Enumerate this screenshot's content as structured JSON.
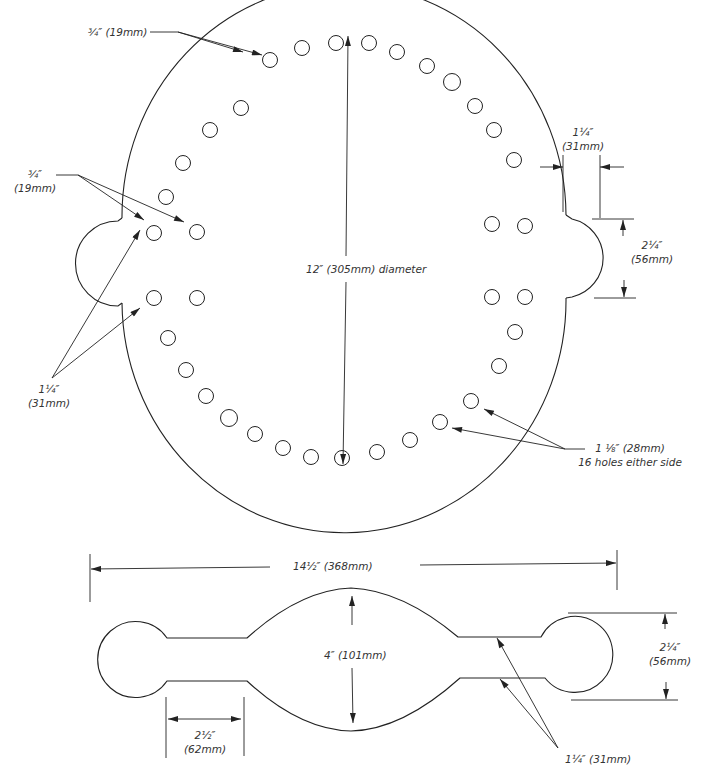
{
  "diagram": {
    "type": "technical-drawing",
    "colors": {
      "line": "#222222",
      "text": "#333333",
      "background": "#ffffff"
    },
    "top_part": {
      "name": "circular plate with side lugs",
      "labels": {
        "top_hole_size": "¾″ (19mm)",
        "left_hole_size_line1": "¾″",
        "left_hole_size_line2": "(19mm)",
        "left_spacing_line1": "1¼″",
        "left_spacing_line2": "(31mm)",
        "diameter": "12″ (305mm) diameter",
        "right_offset_line1": "1¼″",
        "right_offset_line2": "(31mm)",
        "lug_width_line1": "2¼″",
        "lug_width_line2": "(56mm)",
        "ring_holes_line1": "1 ⅛″ (28mm)",
        "ring_holes_line2": "16 holes either side"
      }
    },
    "bottom_part": {
      "name": "bar with bulbous ends",
      "labels": {
        "overall_length": "14½″ (368mm)",
        "center_width": "4″ (101mm)",
        "neck_length_line1": "2½″",
        "neck_length_line2": "(62mm)",
        "end_diameter_line1": "2¼″",
        "end_diameter_line2": "(56mm)",
        "neck_width": "1¼″ (31mm)"
      }
    }
  }
}
